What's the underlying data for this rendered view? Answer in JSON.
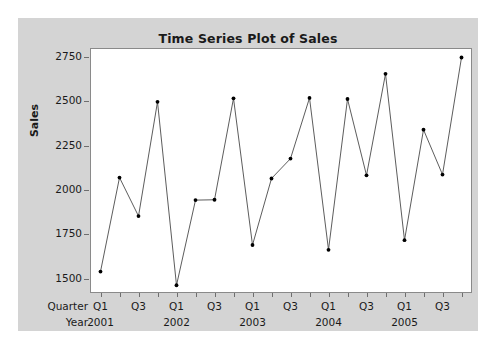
{
  "figure": {
    "background_color": "#d4d4d4",
    "plot_background_color": "#ffffff",
    "frame_color": "#8a8a8a"
  },
  "labels": {
    "quarter_row_title": "Quarter",
    "year_row_title": "Year"
  },
  "chart_data": {
    "type": "line",
    "title": "Time Series Plot of Sales",
    "xlabel": "",
    "ylabel": "Sales",
    "ylim": [
      1430,
      2800
    ],
    "yticks": [
      1500,
      1750,
      2000,
      2250,
      2500,
      2750
    ],
    "ytick_labels": [
      "1500",
      "1750",
      "2000",
      "2250",
      "2500",
      "2750"
    ],
    "grid": false,
    "legend": false,
    "marker": "filled-circle",
    "marker_color": "#000000",
    "line_color": "#4a4a4a",
    "x": [
      "2001 Q1",
      "2001 Q2",
      "2001 Q3",
      "2001 Q4",
      "2002 Q1",
      "2002 Q2",
      "2002 Q3",
      "2002 Q4",
      "2003 Q1",
      "2003 Q2",
      "2003 Q3",
      "2003 Q4",
      "2004 Q1",
      "2004 Q2",
      "2004 Q3",
      "2004 Q4",
      "2005 Q1",
      "2005 Q2",
      "2005 Q3",
      "2005 Q4"
    ],
    "quarter_tick_labels": [
      "Q1",
      "",
      "Q3",
      "",
      "Q1",
      "",
      "Q3",
      "",
      "Q1",
      "",
      "Q3",
      "",
      "Q1",
      "",
      "Q3",
      "",
      "Q1",
      "",
      "Q3",
      ""
    ],
    "year_tick_labels": [
      "2001",
      "",
      "",
      "",
      "2002",
      "",
      "",
      "",
      "2003",
      "",
      "",
      "",
      "2004",
      "",
      "",
      "",
      "2005",
      "",
      "",
      ""
    ],
    "values": [
      1545,
      2075,
      1858,
      2502,
      1468,
      1948,
      1950,
      2522,
      1695,
      2070,
      2182,
      2524,
      1668,
      2518,
      2088,
      2660,
      1722,
      2345,
      2092,
      2752
    ],
    "series": [
      {
        "name": "Sales",
        "values": [
          1545,
          2075,
          1858,
          2502,
          1468,
          1948,
          1950,
          2522,
          1695,
          2070,
          2182,
          2524,
          1668,
          2518,
          2088,
          2660,
          1722,
          2345,
          2092,
          2752
        ]
      }
    ]
  }
}
